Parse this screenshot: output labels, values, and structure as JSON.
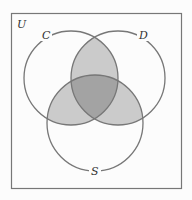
{
  "diagram": {
    "type": "venn",
    "universe_label": "U",
    "sets": [
      {
        "name": "C",
        "label": "C"
      },
      {
        "name": "D",
        "label": "D"
      },
      {
        "name": "S",
        "label": "S"
      }
    ],
    "shaded_regions": [
      "C∩D",
      "C∩S",
      "D∩S"
    ],
    "darker_region": "C∩D∩S",
    "colors": {
      "background": "#fcfcfc",
      "outline": "#777777",
      "pair_shade": "#cbcbcb",
      "triple_shade": "#a3a3a3"
    }
  }
}
